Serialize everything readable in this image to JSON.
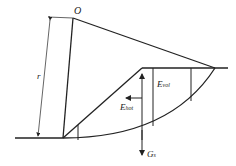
{
  "diagram": {
    "labels": {
      "center": "O",
      "radius": "r",
      "e_vol_main": "E",
      "e_vol_sub": "vol",
      "e_hot_main": "E",
      "e_hot_sub": "hot",
      "g_main": "G",
      "g_sub": "s"
    },
    "colors": {
      "line": "#222222",
      "background": "#ffffff"
    }
  }
}
